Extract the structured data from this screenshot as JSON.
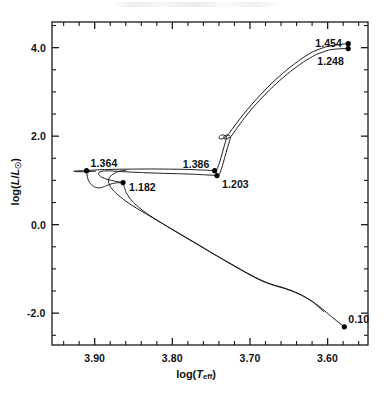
{
  "figure": {
    "background_color": "#ffffff",
    "frame_color": "#1a1a1a",
    "curve_color": "#1a1a1a",
    "marker_color": "#000000",
    "width": 392,
    "height": 395
  },
  "axes": {
    "x_title_parts": {
      "pre": "log(",
      "var": "T",
      "sub": "eff",
      "post": ")"
    },
    "y_title_parts": {
      "pre": "log(",
      "var": "L",
      "slash": "/",
      "var2": "L",
      "sub": "☉",
      "post": ")"
    },
    "x_title_plain": "log(Teff)",
    "y_title_plain": "log(L/Lsun)"
  },
  "chart_data": {
    "type": "line",
    "title": "",
    "subtitle": "",
    "xlabel": "log(T_eff)",
    "ylabel": "log(L/L_sun)",
    "xlim": [
      3.955,
      3.548
    ],
    "ylim": [
      -2.72,
      4.58
    ],
    "x_inverted": true,
    "grid": false,
    "legend": false,
    "xticks_major": [
      "3.90",
      "3.80",
      "3.70",
      "3.60"
    ],
    "xticks_major_values": [
      3.9,
      3.8,
      3.7,
      3.6
    ],
    "xticks_minor_values": [
      3.94,
      3.92,
      3.88,
      3.86,
      3.84,
      3.82,
      3.78,
      3.76,
      3.74,
      3.72,
      3.68,
      3.66,
      3.64,
      3.62,
      3.58,
      3.56
    ],
    "yticks_major": [
      "4.0",
      "2.0",
      "0.0",
      "-2.0"
    ],
    "yticks_major_values": [
      4.0,
      2.0,
      0.0,
      -2.0
    ],
    "yticks_minor_values": [
      4.5,
      3.5,
      3.0,
      2.5,
      1.5,
      1.0,
      0.5,
      -0.5,
      -1.0,
      -1.5,
      -2.5
    ],
    "annotations": [
      {
        "label": "1.454",
        "x": 3.5735,
        "y": 4.09,
        "anchor": "left-of-point",
        "marker": true
      },
      {
        "label": "1.248",
        "x": 3.5735,
        "y": 3.98,
        "anchor": "below-left",
        "marker": true
      },
      {
        "label": "1.364",
        "x": 3.9105,
        "y": 1.22,
        "anchor": "above-right",
        "marker": true
      },
      {
        "label": "1.182",
        "x": 3.8635,
        "y": 0.95,
        "anchor": "right-of-point",
        "marker": true
      },
      {
        "label": "1.386",
        "x": 3.7455,
        "y": 1.22,
        "anchor": "above-left",
        "marker": true
      },
      {
        "label": "1.203",
        "x": 3.7425,
        "y": 1.11,
        "anchor": "below-right",
        "marker": true
      },
      {
        "label": "0.10",
        "x": 3.5785,
        "y": -2.31,
        "anchor": "above-right",
        "marker": true
      }
    ],
    "series": [
      {
        "name": "track-upper",
        "comment": "evolutionary track ending at 1.454 / 1.386 / 1.364",
        "points": [
          [
            3.9105,
            1.22
          ],
          [
            3.9005,
            1.235
          ],
          [
            3.8875,
            1.245
          ],
          [
            3.87,
            1.252
          ],
          [
            3.85,
            1.256
          ],
          [
            3.828,
            1.258
          ],
          [
            3.805,
            1.255
          ],
          [
            3.786,
            1.25
          ],
          [
            3.769,
            1.24
          ],
          [
            3.756,
            1.23
          ],
          [
            3.749,
            1.224
          ],
          [
            3.7455,
            1.22
          ],
          [
            3.7425,
            1.255
          ],
          [
            3.74,
            1.36
          ],
          [
            3.7368,
            1.55
          ],
          [
            3.7336,
            1.75
          ],
          [
            3.7312,
            1.9
          ],
          [
            3.73,
            1.975
          ],
          [
            3.7318,
            2.012
          ],
          [
            3.735,
            2.03
          ],
          [
            3.7382,
            2.015
          ],
          [
            3.74,
            1.975
          ],
          [
            3.7392,
            1.94
          ],
          [
            3.7352,
            1.942
          ],
          [
            3.7305,
            1.985
          ],
          [
            3.727,
            2.06
          ],
          [
            3.722,
            2.18
          ],
          [
            3.714,
            2.37
          ],
          [
            3.7035,
            2.6
          ],
          [
            3.691,
            2.85
          ],
          [
            3.678,
            3.09
          ],
          [
            3.665,
            3.31
          ],
          [
            3.651,
            3.52
          ],
          [
            3.636,
            3.72
          ],
          [
            3.62,
            3.9
          ],
          [
            3.602,
            4.02
          ],
          [
            3.588,
            4.065
          ],
          [
            3.58,
            4.082
          ],
          [
            3.5735,
            4.09
          ]
        ]
      },
      {
        "name": "track-lower",
        "comment": "second evolutionary track ending at 1.248 / 1.203 / 1.182",
        "points": [
          [
            3.8635,
            0.95
          ],
          [
            3.876,
            0.99
          ],
          [
            3.886,
            1.035
          ],
          [
            3.892,
            1.085
          ],
          [
            3.895,
            1.14
          ],
          [
            3.894,
            1.185
          ],
          [
            3.889,
            1.212
          ],
          [
            3.88,
            1.215
          ],
          [
            3.87,
            1.205
          ],
          [
            3.856,
            1.19
          ],
          [
            3.837,
            1.175
          ],
          [
            3.816,
            1.162
          ],
          [
            3.795,
            1.152
          ],
          [
            3.776,
            1.142
          ],
          [
            3.76,
            1.128
          ],
          [
            3.749,
            1.118
          ],
          [
            3.7425,
            1.11
          ],
          [
            3.739,
            1.155
          ],
          [
            3.736,
            1.3
          ],
          [
            3.7325,
            1.52
          ],
          [
            3.729,
            1.74
          ],
          [
            3.7262,
            1.9
          ],
          [
            3.7248,
            1.975
          ],
          [
            3.7262,
            2.012
          ],
          [
            3.7292,
            2.028
          ],
          [
            3.7322,
            2.012
          ],
          [
            3.734,
            1.975
          ],
          [
            3.7332,
            1.938
          ],
          [
            3.7292,
            1.942
          ],
          [
            3.7248,
            1.988
          ],
          [
            3.7212,
            2.07
          ],
          [
            3.716,
            2.2
          ],
          [
            3.708,
            2.39
          ],
          [
            3.6975,
            2.62
          ],
          [
            3.685,
            2.86
          ],
          [
            3.672,
            3.09
          ],
          [
            3.659,
            3.3
          ],
          [
            3.645,
            3.5
          ],
          [
            3.63,
            3.69
          ],
          [
            3.614,
            3.85
          ],
          [
            3.5975,
            3.95
          ],
          [
            3.585,
            3.975
          ],
          [
            3.5735,
            3.98
          ]
        ]
      },
      {
        "name": "pre-main-sequence-descent",
        "comment": "Hayashi/contraction branch from 0.10 up to the turn region near log T 3.87",
        "points": [
          [
            3.5785,
            -2.31
          ],
          [
            3.588,
            -2.18
          ],
          [
            3.599,
            -2.02
          ],
          [
            3.61,
            -1.86
          ],
          [
            3.621,
            -1.72
          ],
          [
            3.633,
            -1.6
          ],
          [
            3.645,
            -1.5
          ],
          [
            3.657,
            -1.425
          ],
          [
            3.668,
            -1.37
          ],
          [
            3.679,
            -1.305
          ],
          [
            3.692,
            -1.2
          ],
          [
            3.706,
            -1.07
          ],
          [
            3.72,
            -0.93
          ],
          [
            3.734,
            -0.79
          ],
          [
            3.748,
            -0.65
          ],
          [
            3.762,
            -0.5
          ],
          [
            3.776,
            -0.355
          ],
          [
            3.79,
            -0.21
          ],
          [
            3.804,
            -0.065
          ],
          [
            3.818,
            0.08
          ],
          [
            3.832,
            0.225
          ],
          [
            3.844,
            0.35
          ],
          [
            3.855,
            0.47
          ],
          [
            3.865,
            0.6
          ],
          [
            3.873,
            0.72
          ],
          [
            3.879,
            0.835
          ],
          [
            3.882,
            0.945
          ],
          [
            3.8818,
            1.04
          ],
          [
            3.8782,
            1.12
          ],
          [
            3.872,
            1.185
          ],
          [
            3.866,
            1.215
          ],
          [
            3.86,
            1.228
          ]
        ]
      },
      {
        "name": "pre-main-sequence-branch-2",
        "comment": "second contraction branch converging with the first near log T 3.83",
        "points": [
          [
            3.605,
            -1.97
          ],
          [
            3.618,
            -1.76
          ],
          [
            3.631,
            -1.615
          ],
          [
            3.644,
            -1.515
          ],
          [
            3.656,
            -1.44
          ],
          [
            3.669,
            -1.375
          ],
          [
            3.683,
            -1.285
          ],
          [
            3.697,
            -1.165
          ],
          [
            3.711,
            -1.03
          ],
          [
            3.725,
            -0.89
          ],
          [
            3.739,
            -0.745
          ],
          [
            3.753,
            -0.6
          ],
          [
            3.767,
            -0.455
          ],
          [
            3.781,
            -0.31
          ],
          [
            3.795,
            -0.165
          ],
          [
            3.809,
            -0.015
          ],
          [
            3.822,
            0.125
          ],
          [
            3.833,
            0.255
          ],
          [
            3.842,
            0.375
          ],
          [
            3.85,
            0.5
          ],
          [
            3.856,
            0.625
          ],
          [
            3.86,
            0.75
          ],
          [
            3.862,
            0.86
          ],
          [
            3.8632,
            0.93
          ],
          [
            3.8635,
            0.95
          ]
        ]
      },
      {
        "name": "turn-to-left-hook",
        "comment": "hook from the 1.182 point down-left then up to the 1.364 point",
        "points": [
          [
            3.8635,
            0.95
          ],
          [
            3.872,
            0.945
          ],
          [
            3.879,
            0.92
          ],
          [
            3.885,
            0.88
          ],
          [
            3.89,
            0.845
          ],
          [
            3.8945,
            0.83
          ],
          [
            3.899,
            0.845
          ],
          [
            3.9035,
            0.89
          ],
          [
            3.907,
            0.96
          ],
          [
            3.909,
            1.05
          ],
          [
            3.91,
            1.14
          ],
          [
            3.9105,
            1.22
          ]
        ]
      },
      {
        "name": "left-hook-return",
        "comment": "short return stroke left of the 1.364 marker",
        "points": [
          [
            3.9105,
            1.22
          ],
          [
            3.919,
            1.218
          ],
          [
            3.925,
            1.212
          ],
          [
            3.927,
            1.205
          ],
          [
            3.924,
            1.198
          ],
          [
            3.916,
            1.196
          ],
          [
            3.906,
            1.2
          ],
          [
            3.899,
            1.208
          ]
        ]
      }
    ]
  },
  "tick_labels": {
    "x": [
      {
        "text": "3.90",
        "value": 3.9
      },
      {
        "text": "3.80",
        "value": 3.8
      },
      {
        "text": "3.70",
        "value": 3.7
      },
      {
        "text": "3.60",
        "value": 3.6
      }
    ],
    "y": [
      {
        "text": "4.0",
        "value": 4.0
      },
      {
        "text": "2.0",
        "value": 2.0
      },
      {
        "text": "0.0",
        "value": 0.0
      },
      {
        "text": "-2.0",
        "value": -2.0
      }
    ]
  }
}
